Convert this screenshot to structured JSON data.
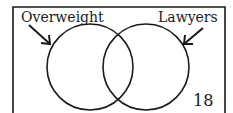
{
  "diagram": {
    "type": "venn",
    "sets": [
      {
        "label": "Overweight"
      },
      {
        "label": "Lawyers"
      }
    ],
    "region_number": "18",
    "colors": {
      "stroke": "#1a1a1a",
      "background": "#ffffff"
    }
  }
}
